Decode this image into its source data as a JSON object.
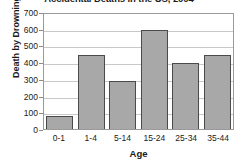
{
  "chart_data": {
    "type": "bar",
    "title": "Accidental Deaths in the US, 2004",
    "xlabel": "Age",
    "ylabel": "Death by Drowning",
    "categories": [
      "0-1",
      "1-4",
      "5-14",
      "15-24",
      "25-34",
      "35-44"
    ],
    "values": [
      80,
      440,
      290,
      590,
      395,
      440
    ],
    "ylim": [
      0,
      700
    ],
    "ytick_labels": [
      "700",
      "600",
      "500",
      "400",
      "300",
      "200",
      "100",
      "0"
    ],
    "ytick_values": [
      700,
      600,
      500,
      400,
      300,
      200,
      100,
      0
    ],
    "grid": true,
    "legend": null,
    "colors": {
      "bar_fill": "#a8a8a8",
      "bar_stroke": "#4a4a4a",
      "gridline": "#c9c9c9",
      "axis": "#9a9a9a",
      "text": "#1a1a1a",
      "background": "#ffffff"
    }
  }
}
